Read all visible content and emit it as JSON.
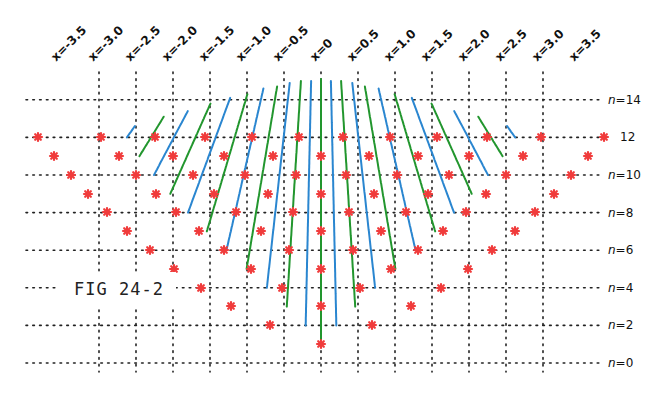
{
  "figure_label": "FIG 24-2",
  "colors": {
    "blue": "#2a86d0",
    "green": "#22962e",
    "star": "#f03c3c",
    "grid": "#222222"
  },
  "chart_data": {
    "type": "line",
    "title": "FIG 24-2",
    "xlabel": "x",
    "ylabel": "n",
    "x_ticks": [
      "x=-3.5",
      "x=-3.0",
      "x=-2.5",
      "x=-2.0",
      "x=-1.5",
      "x=-1.0",
      "x=-0.5",
      "x=0",
      "x=0.5",
      "x=1.0",
      "x=1.5",
      "x=2.0",
      "x=2.5",
      "x=3.0",
      "x=3.5"
    ],
    "x_values": [
      -3.5,
      -3.0,
      -2.5,
      -2.0,
      -1.5,
      -1.0,
      -0.5,
      0,
      0.5,
      1.0,
      1.5,
      2.0,
      2.5,
      3.0,
      3.5
    ],
    "y_ticks": [
      "n=0",
      "n=2",
      "n=4",
      "n=6",
      "n=8",
      "n=10",
      "12",
      "n=14"
    ],
    "y_values": [
      0,
      2,
      4,
      6,
      8,
      10,
      12,
      14
    ],
    "xlim": [
      -3.75,
      3.75
    ],
    "ylim": [
      0,
      14
    ],
    "grid": "dotted",
    "legend": "none",
    "series_description": "Alternating green (even k) and blue (odd k) curves, k = -11..11; curve k begins at n = |k|+1 and rises upward, bending outward. Red asterisks mark discrete points at integer n on each curve.",
    "star_points": {
      "note": "Right half (x >= 0); left half is mirror image about x=0.",
      "rows": [
        {
          "n": 12,
          "x": [
            0.15,
            0.47,
            0.78,
            1.12,
            1.48,
            1.91
          ]
        },
        {
          "n": 11,
          "x": [
            0.0,
            0.32,
            0.65,
            1.0,
            1.36,
            1.8
          ]
        },
        {
          "n": 10,
          "x": [
            0.17,
            0.51,
            0.86,
            1.25,
            1.69
          ]
        },
        {
          "n": 9,
          "x": [
            0.0,
            0.36,
            0.72,
            1.11,
            1.57
          ]
        },
        {
          "n": 8,
          "x": [
            0.19,
            0.57,
            0.98,
            1.45
          ]
        },
        {
          "n": 7,
          "x": [
            0.0,
            0.41,
            0.83,
            1.31
          ]
        },
        {
          "n": 6,
          "x": [
            0.22,
            0.66,
            1.16
          ]
        },
        {
          "n": 5,
          "x": [
            0.0,
            0.47,
            0.99
          ]
        },
        {
          "n": 4,
          "x": [
            0.26,
            0.81
          ]
        },
        {
          "n": 3,
          "x": [
            0.0,
            0.61
          ]
        },
        {
          "n": 2,
          "x": [
            0.34
          ]
        },
        {
          "n": 1,
          "x": [
            0.0
          ]
        }
      ]
    }
  },
  "geometry": {
    "x0_px": 321,
    "x_step_px": 37,
    "n0_px": 363,
    "n_step_px": 18.8
  },
  "star_rows": [
    {
      "y": 137,
      "xs": [
        343,
        390,
        437,
        487,
        541,
        604
      ]
    },
    {
      "y": 156,
      "xs": [
        321,
        369,
        418,
        469,
        523,
        588
      ]
    },
    {
      "y": 175,
      "xs": [
        346,
        397,
        449,
        506,
        571
      ]
    },
    {
      "y": 194,
      "xs": [
        321,
        374,
        428,
        486,
        554
      ]
    },
    {
      "y": 212,
      "xs": [
        349,
        406,
        466,
        535
      ]
    },
    {
      "y": 231,
      "xs": [
        321,
        381,
        443,
        515
      ]
    },
    {
      "y": 250,
      "xs": [
        353,
        418,
        492
      ]
    },
    {
      "y": 269,
      "xs": [
        321,
        391,
        468
      ]
    },
    {
      "y": 288,
      "xs": [
        360,
        441
      ]
    },
    {
      "y": 306,
      "xs": [
        321,
        411
      ]
    },
    {
      "y": 325,
      "xs": [
        372
      ]
    },
    {
      "y": 344,
      "xs": [
        321
      ]
    }
  ]
}
